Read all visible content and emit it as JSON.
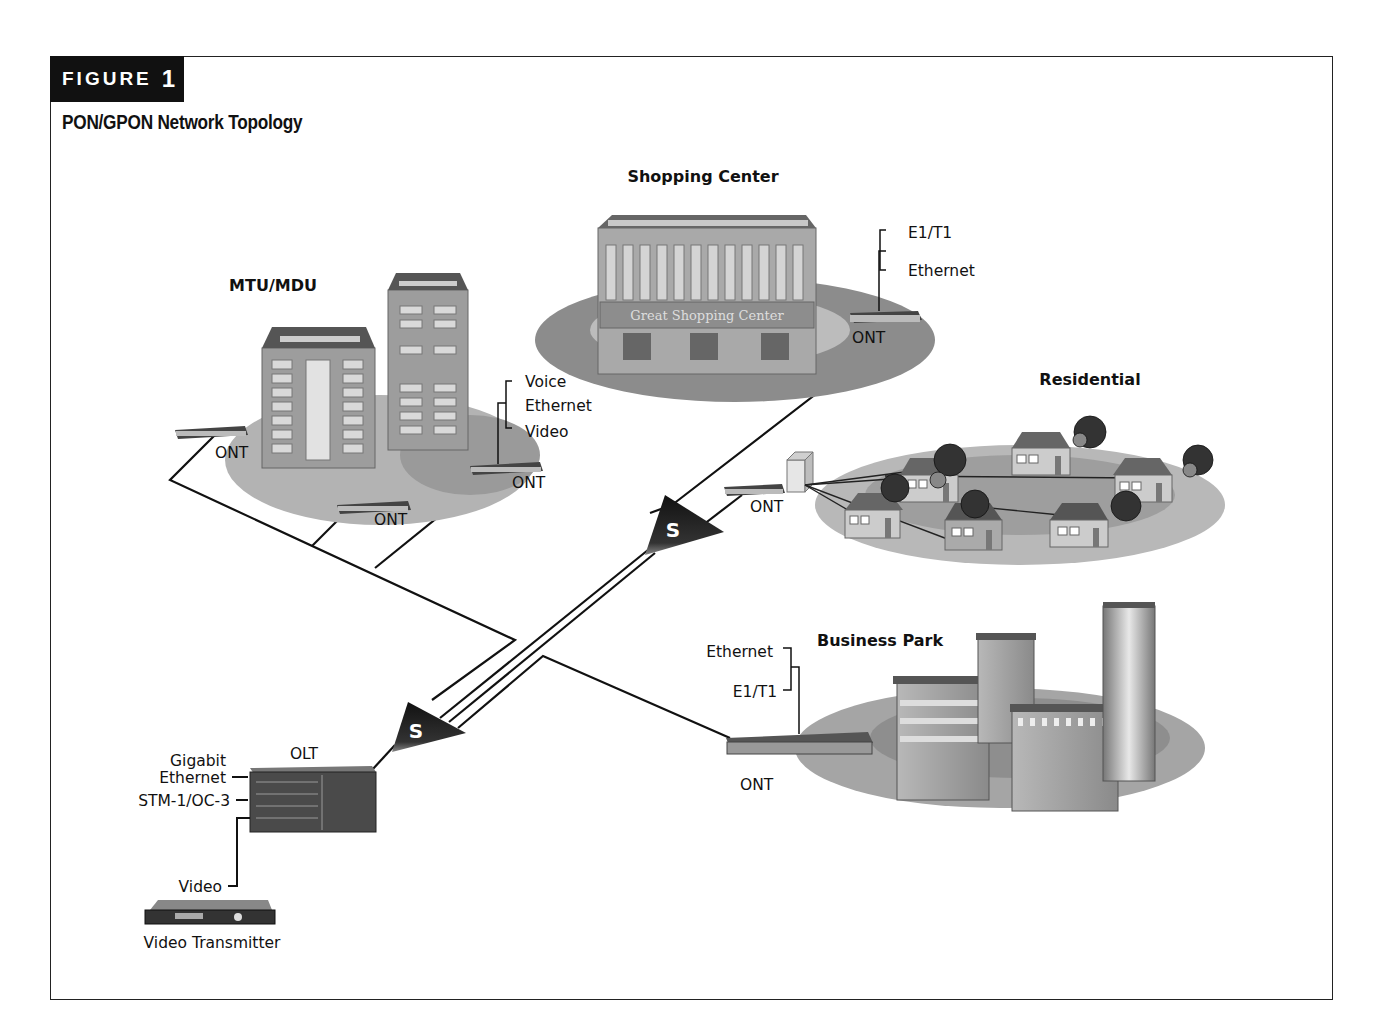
{
  "figure": {
    "tab_label": "FIGURE",
    "tab_number": "1",
    "title": "PON/GPON Network Topology"
  },
  "sites": {
    "shopping_center": {
      "heading": "Shopping Center",
      "sign": "Great Shopping Center",
      "ont_label": "ONT",
      "services": [
        "E1/T1",
        "Ethernet"
      ]
    },
    "mtu_mdu": {
      "heading": "MTU/MDU",
      "ont_labels": [
        "ONT",
        "ONT",
        "ONT"
      ],
      "services": [
        "Voice",
        "Ethernet",
        "Video"
      ]
    },
    "residential": {
      "heading": "Residential",
      "ont_label": "ONT"
    },
    "business_park": {
      "heading": "Business Park",
      "ont_label": "ONT",
      "services": [
        "Ethernet",
        "E1/T1"
      ]
    }
  },
  "central_office": {
    "olt_label": "OLT",
    "inputs": [
      "Gigabit",
      "Ethernet",
      "STM-1/OC-3",
      "Video"
    ],
    "video_transmitter_label": "Video Transmitter"
  },
  "splitters": [
    {
      "label": "S"
    },
    {
      "label": "S"
    }
  ],
  "colors": {
    "ink": "#111111",
    "ground_dark": "#8c8c8c",
    "ground_light": "#c4c4c4",
    "building": "#9a9a9a",
    "splitter": "#2a2a2a"
  }
}
